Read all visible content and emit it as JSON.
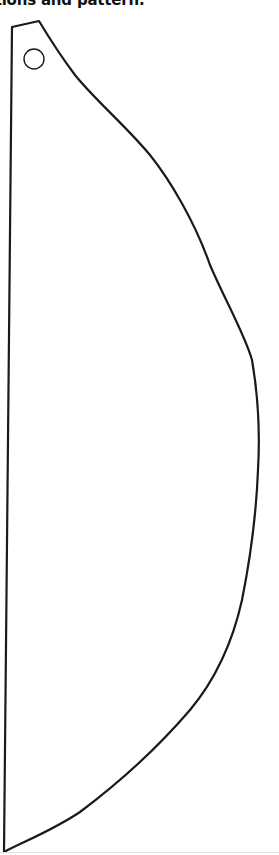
{
  "caption": {
    "text": "ctions and pattern."
  },
  "pattern": {
    "shape": "paper-fan-half-piece",
    "stroke_color": "#1a1a1a",
    "fill_color": "#ffffff",
    "hole": {
      "cx": 34,
      "cy": 59,
      "r": 10
    }
  }
}
